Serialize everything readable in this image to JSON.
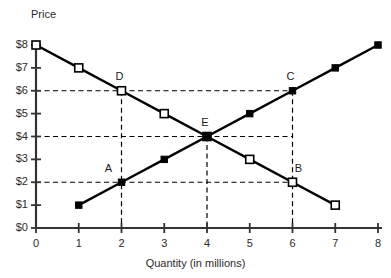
{
  "chart_data": {
    "type": "line",
    "title": "",
    "xlabel": "Quantity (in millions)",
    "ylabel": "Price",
    "xlim": [
      0,
      8
    ],
    "ylim": [
      0,
      8
    ],
    "grid": false,
    "legend_position": "none",
    "x_tick_labels": [
      "0",
      "1",
      "2",
      "3",
      "4",
      "5",
      "6",
      "7",
      "8"
    ],
    "x_ticks": [
      0,
      1,
      2,
      3,
      4,
      5,
      6,
      7,
      8
    ],
    "y_tick_labels": [
      "$0",
      "$1",
      "$2",
      "$3",
      "$4",
      "$5",
      "$6",
      "$7",
      "$8"
    ],
    "y_ticks": [
      0,
      1,
      2,
      3,
      4,
      5,
      6,
      7,
      8
    ],
    "series": [
      {
        "name": "Demand",
        "marker": "open-square",
        "x": [
          0,
          1,
          2,
          3,
          4,
          5,
          6,
          7
        ],
        "values": [
          8,
          7,
          6,
          5,
          4,
          3,
          2,
          1
        ]
      },
      {
        "name": "Supply",
        "marker": "filled-square",
        "x": [
          1,
          2,
          3,
          4,
          5,
          6,
          7,
          8
        ],
        "values": [
          1,
          2,
          3,
          4,
          5,
          6,
          7,
          8
        ]
      }
    ],
    "annotations": [
      {
        "label": "A",
        "x": 2,
        "y": 2,
        "on": "Supply"
      },
      {
        "label": "B",
        "x": 6,
        "y": 2,
        "on": "Demand"
      },
      {
        "label": "C",
        "x": 6,
        "y": 6,
        "on": "Supply"
      },
      {
        "label": "D",
        "x": 2,
        "y": 6,
        "on": "Demand"
      },
      {
        "label": "E",
        "x": 4,
        "y": 4,
        "on": "Equilibrium"
      }
    ],
    "guide_lines": {
      "horizontal_y": [
        2,
        4,
        6
      ],
      "vertical_x": [
        2,
        4,
        6
      ]
    },
    "colors": {
      "axis": "#333333",
      "line": "#000000",
      "guide": "#000000",
      "background": "#ffffff"
    }
  }
}
